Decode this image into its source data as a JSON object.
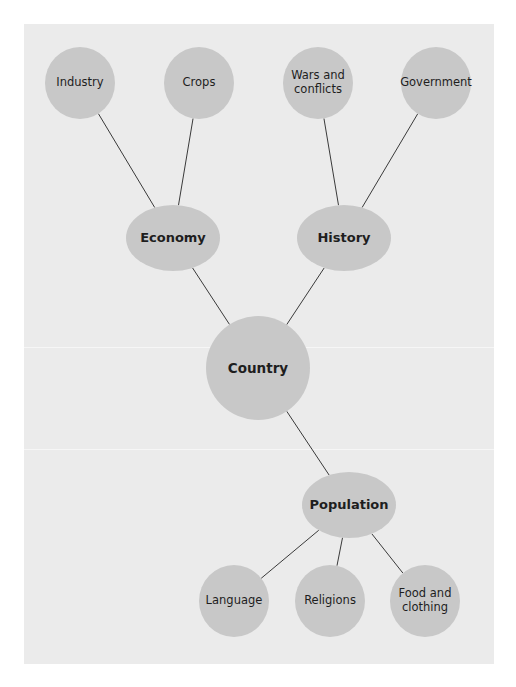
{
  "diagram": {
    "type": "mind-map",
    "colors": {
      "background": "#ebebeb",
      "node_fill": "#c8c8c8",
      "edge": "#3a3a3a",
      "text": "#1e1e1e"
    },
    "nodes": [
      {
        "id": "country",
        "label": "Country",
        "level": "root"
      },
      {
        "id": "economy",
        "label": "Economy",
        "level": "mid"
      },
      {
        "id": "history",
        "label": "History",
        "level": "mid"
      },
      {
        "id": "population",
        "label": "Population",
        "level": "mid"
      },
      {
        "id": "industry",
        "label": "Industry",
        "level": "leaf"
      },
      {
        "id": "crops",
        "label": "Crops",
        "level": "leaf"
      },
      {
        "id": "wars",
        "label": "Wars and conflicts",
        "level": "leaf"
      },
      {
        "id": "government",
        "label": "Government",
        "level": "leaf"
      },
      {
        "id": "language",
        "label": "Language",
        "level": "leaf"
      },
      {
        "id": "religions",
        "label": "Religions",
        "level": "leaf"
      },
      {
        "id": "food",
        "label": "Food and clothing",
        "level": "leaf"
      }
    ],
    "edges": [
      [
        "country",
        "economy"
      ],
      [
        "country",
        "history"
      ],
      [
        "country",
        "population"
      ],
      [
        "economy",
        "industry"
      ],
      [
        "economy",
        "crops"
      ],
      [
        "history",
        "wars"
      ],
      [
        "history",
        "government"
      ],
      [
        "population",
        "language"
      ],
      [
        "population",
        "religions"
      ],
      [
        "population",
        "food"
      ]
    ]
  }
}
